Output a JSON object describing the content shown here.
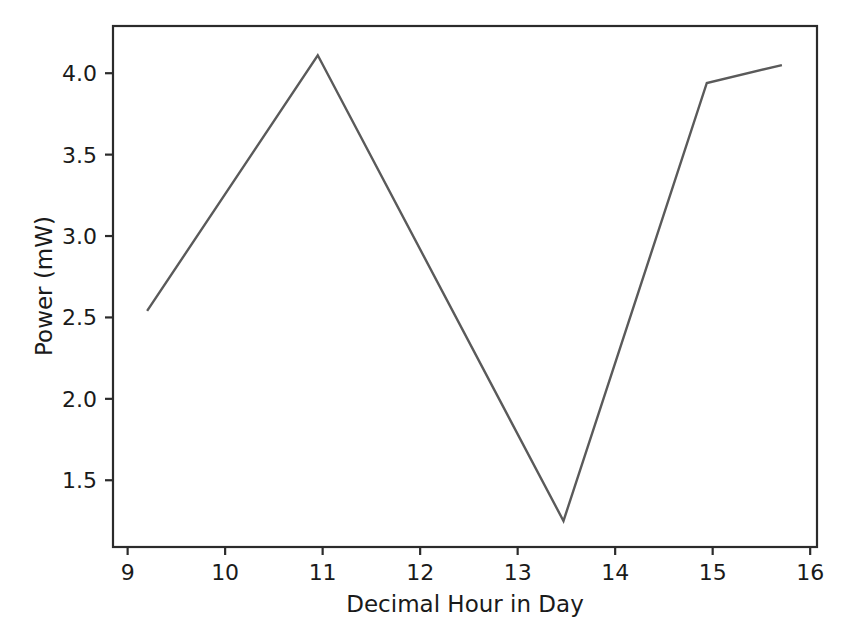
{
  "chart_data": {
    "type": "line",
    "title": "",
    "xlabel": "Decimal Hour in Day",
    "ylabel": "Power (mW)",
    "xlim": [
      8.85,
      16.07
    ],
    "ylim": [
      1.09,
      4.29
    ],
    "xticks": [
      9,
      10,
      11,
      12,
      13,
      14,
      15,
      16
    ],
    "xticklabels": [
      "9",
      "10",
      "11",
      "12",
      "13",
      "14",
      "15",
      "16"
    ],
    "yticks": [
      1.5,
      2.0,
      2.5,
      3.0,
      3.5,
      4.0
    ],
    "yticklabels": [
      "1.5",
      "2.0",
      "2.5",
      "3.0",
      "3.5",
      "4.0"
    ],
    "grid": false,
    "legend": false,
    "series": [
      {
        "name": "Power",
        "color": "#5a5a5a",
        "x": [
          9.2,
          10.95,
          13.47,
          14.94,
          15.71
        ],
        "values": [
          2.54,
          4.11,
          1.25,
          3.94,
          4.05
        ]
      }
    ]
  },
  "axis": {
    "x_title": "Decimal Hour in Day",
    "y_title": "Power (mW)"
  }
}
